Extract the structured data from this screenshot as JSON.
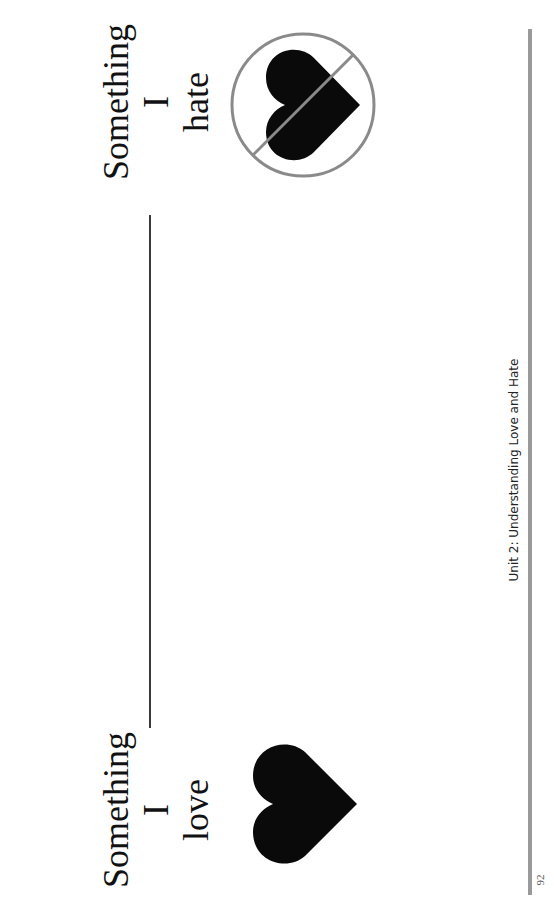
{
  "worksheet": {
    "love_block": {
      "lines": [
        "Something",
        "I",
        "love"
      ],
      "icon": "heart-icon"
    },
    "hate_block": {
      "lines": [
        "Something",
        "I",
        "hate"
      ],
      "icon": "no-heart-icon"
    },
    "answer_line": "blank write-in line"
  },
  "footer": {
    "title": "Unit 2: Understanding Love and Hate",
    "page_number": "92"
  },
  "colors": {
    "ink": "#111111",
    "prohibition_circle": "#8a8a8a",
    "footer_rule": "#9a9a9a"
  }
}
